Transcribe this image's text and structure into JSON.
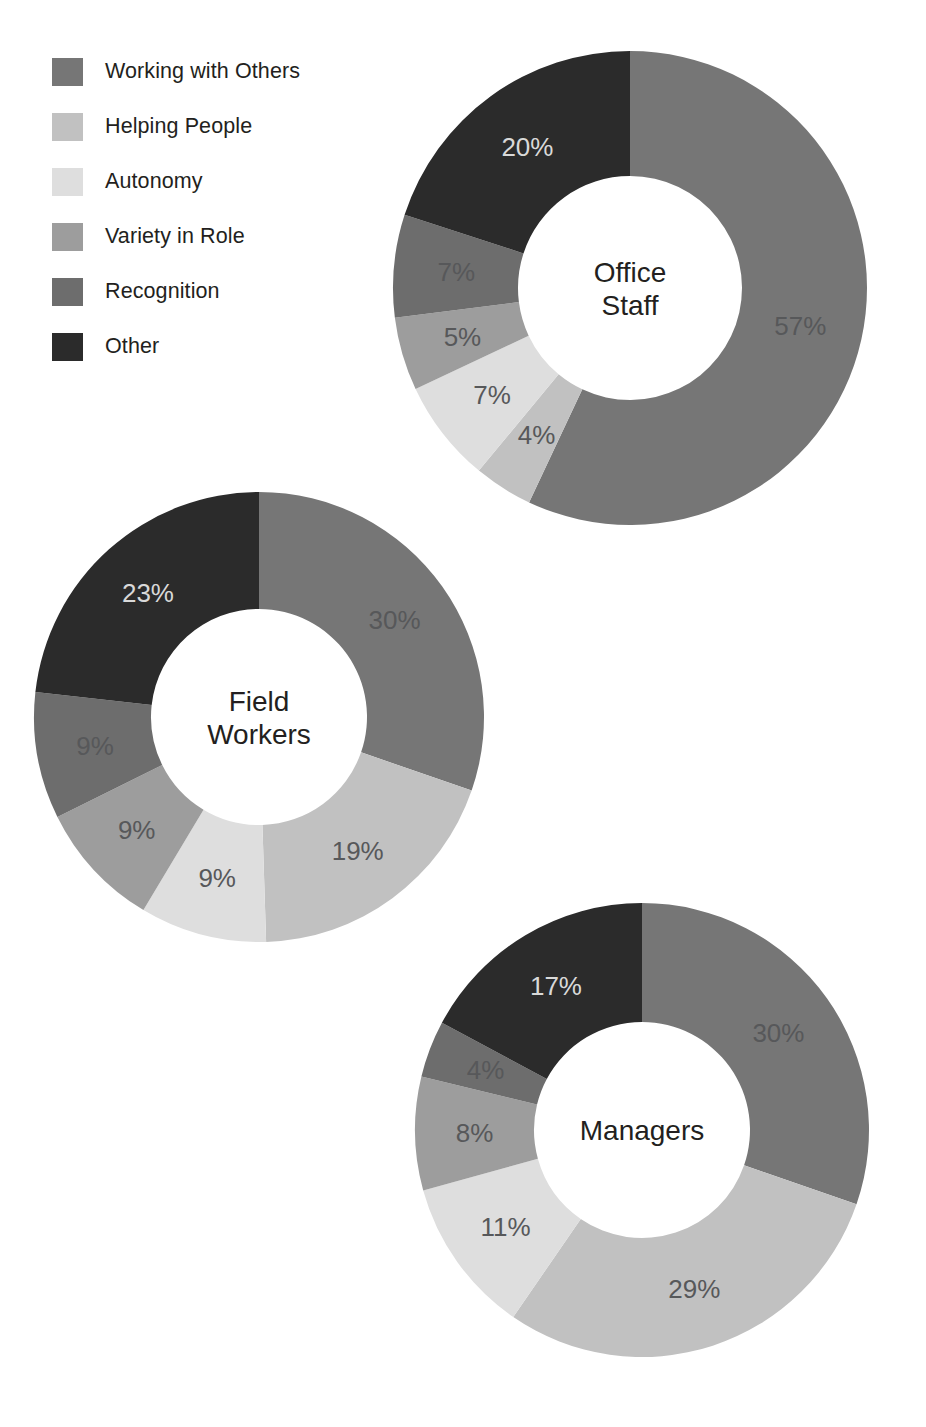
{
  "legend": {
    "items": [
      {
        "label": "Working with Others",
        "color": "#767676"
      },
      {
        "label": "Helping People",
        "color": "#c1c1c1"
      },
      {
        "label": "Autonomy",
        "color": "#dedede"
      },
      {
        "label": "Variety in Role",
        "color": "#9d9d9d"
      },
      {
        "label": "Recognition",
        "color": "#6d6d6d"
      },
      {
        "label": "Other",
        "color": "#2b2b2b"
      }
    ]
  },
  "chart_data": [
    {
      "type": "pie",
      "title": "Office Staff",
      "title_lines": [
        "Office",
        "Staff"
      ],
      "categories": [
        "Working with Others",
        "Helping People",
        "Autonomy",
        "Variety in Role",
        "Recognition",
        "Other"
      ],
      "values": [
        57,
        4,
        7,
        5,
        7,
        20
      ],
      "labels": [
        "57%",
        "4%",
        "7%",
        "5%",
        "7%",
        "20%"
      ],
      "colors": [
        "#767676",
        "#c1c1c1",
        "#dedede",
        "#9d9d9d",
        "#6d6d6d",
        "#2b2b2b"
      ],
      "label_on_dark": [
        false,
        false,
        false,
        false,
        false,
        true
      ],
      "geometry": {
        "cx": 630,
        "cy": 288,
        "r_outer": 237,
        "r_inner": 112,
        "start_angle": 0
      },
      "legend_position": "top-left",
      "grid": false
    },
    {
      "type": "pie",
      "title": "Field Workers",
      "title_lines": [
        "Field",
        "Workers"
      ],
      "categories": [
        "Working with Others",
        "Helping People",
        "Autonomy",
        "Variety in Role",
        "Recognition",
        "Other"
      ],
      "values": [
        30,
        19,
        9,
        9,
        9,
        23
      ],
      "labels": [
        "30%",
        "19%",
        "9%",
        "9%",
        "9%",
        "23%"
      ],
      "colors": [
        "#767676",
        "#c1c1c1",
        "#dedede",
        "#9d9d9d",
        "#6d6d6d",
        "#2b2b2b"
      ],
      "label_on_dark": [
        false,
        false,
        false,
        false,
        false,
        true
      ],
      "geometry": {
        "cx": 259,
        "cy": 717,
        "r_outer": 225,
        "r_inner": 108,
        "start_angle": 0
      },
      "legend_position": "top-left",
      "grid": false
    },
    {
      "type": "pie",
      "title": "Managers",
      "title_lines": [
        "Managers"
      ],
      "categories": [
        "Working with Others",
        "Helping People",
        "Autonomy",
        "Variety in Role",
        "Recognition",
        "Other"
      ],
      "values": [
        30,
        29,
        11,
        8,
        4,
        17
      ],
      "labels": [
        "30%",
        "29%",
        "11%",
        "8%",
        "4%",
        "17%"
      ],
      "colors": [
        "#767676",
        "#c1c1c1",
        "#dedede",
        "#9d9d9d",
        "#6d6d6d",
        "#2b2b2b"
      ],
      "label_on_dark": [
        false,
        false,
        false,
        false,
        false,
        true
      ],
      "geometry": {
        "cx": 642,
        "cy": 1130,
        "r_outer": 227,
        "r_inner": 108,
        "start_angle": 0
      },
      "legend_position": "top-left",
      "grid": false
    }
  ]
}
